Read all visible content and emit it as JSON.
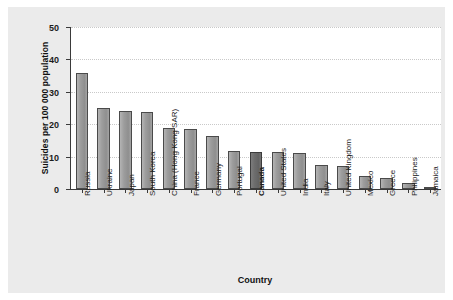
{
  "chart_data": {
    "type": "bar",
    "title": "",
    "xlabel": "Country",
    "ylabel": "Suicides per 100 000 population",
    "ylim": [
      0,
      50
    ],
    "yticks": [
      0,
      10,
      20,
      30,
      40,
      50
    ],
    "grid": true,
    "legend": null,
    "highlight_category": "Canada",
    "categories": [
      "Russia",
      "Ukraine",
      "Japan",
      "South Korea",
      "China (Hong Kong SAR)",
      "France",
      "Germany",
      "Portugal",
      "Canada",
      "United States",
      "India",
      "Italy",
      "United Kingdom",
      "Mexico",
      "Greece",
      "Philippines",
      "Jamaica"
    ],
    "values": [
      35.8,
      25.1,
      24.1,
      23.8,
      18.9,
      18.5,
      16.3,
      11.8,
      11.3,
      11.3,
      11.2,
      7.3,
      7.0,
      4.0,
      3.3,
      2.0,
      0.3
    ]
  },
  "colors": {
    "bar": "#9a9a9a",
    "bar_highlight": "#6d6d6d",
    "axis": "#3a3a3a",
    "grid": "#c9c9c9",
    "panel_background": "#ebebeb",
    "plot_background": "#ffffff"
  }
}
